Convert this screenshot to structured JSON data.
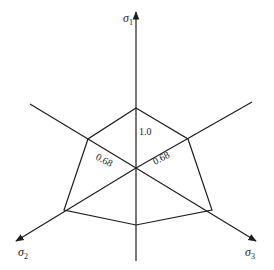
{
  "diagram": {
    "type": "principal-stress-space-polygon",
    "axes": [
      {
        "id": "sigma1",
        "symbol": "σ",
        "subscript": "1"
      },
      {
        "id": "sigma2",
        "symbol": "σ",
        "subscript": "2"
      },
      {
        "id": "sigma3",
        "symbol": "σ",
        "subscript": "3"
      }
    ],
    "values": [
      {
        "label": "1.0",
        "axis": "sigma1"
      },
      {
        "label": "0.68",
        "axis": "sigma2-upper"
      },
      {
        "label": "0.68",
        "axis": "sigma3-upper"
      }
    ]
  }
}
